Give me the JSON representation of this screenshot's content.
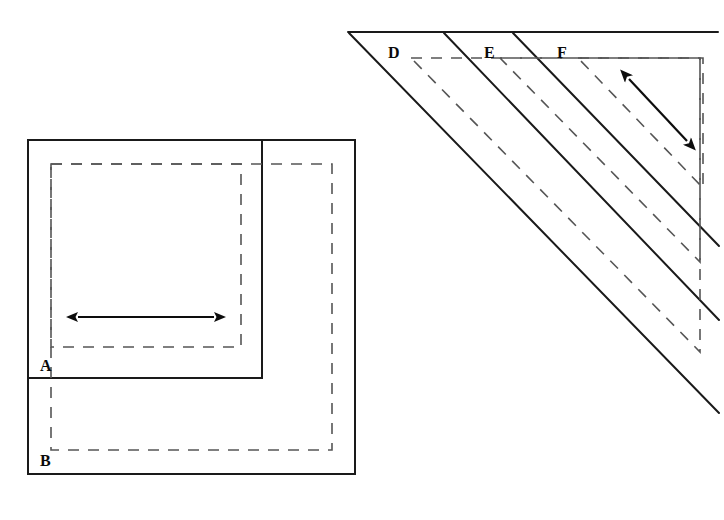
{
  "figure": {
    "title": "",
    "background_color": "#ffffff",
    "stroke_color": "#1a1a1a",
    "dashed_color": "#555555",
    "labels": {
      "a": "A",
      "b": "B",
      "d": "D",
      "e": "E",
      "f": "F"
    },
    "left_panel": {
      "name": "nested-squares-panel",
      "squares": [
        {
          "id": "A",
          "style": "solid",
          "x": 28,
          "y": 140,
          "width": 234,
          "height": 238
        },
        {
          "id": "B",
          "style": "solid",
          "x": 28,
          "y": 140,
          "width": 327,
          "height": 334
        }
      ],
      "dashed_squares": [
        {
          "id": "A-inner",
          "style": "dashed",
          "x": 51,
          "y": 164,
          "width": 190,
          "height": 183
        },
        {
          "id": "B-inner",
          "style": "dashed",
          "x": 51,
          "y": 164,
          "width": 281,
          "height": 286
        }
      ],
      "arrow": {
        "id": "horizontal-double-arrow",
        "type": "double-headed",
        "x1": 78,
        "y1": 317,
        "x2": 214,
        "y2": 317,
        "orientation": "horizontal"
      },
      "label_positions": [
        {
          "text": "A",
          "x": 40,
          "y": 370
        },
        {
          "text": "B",
          "x": 40,
          "y": 465
        }
      ]
    },
    "right_panel": {
      "name": "nested-triangles-panel",
      "top_edge": {
        "x1": 348,
        "y1": 32,
        "x2": 718,
        "y2": 32
      },
      "diagonals": [
        {
          "id": "D",
          "x1": 349,
          "y1": 32,
          "x2": 718,
          "y2": 412
        },
        {
          "id": "E",
          "x1": 444,
          "y1": 32,
          "x2": 718,
          "y2": 320
        },
        {
          "id": "F",
          "x1": 513,
          "y1": 32,
          "x2": 718,
          "y2": 246
        }
      ],
      "dashed_triangles": [
        {
          "id": "D-inner",
          "top_y": 58,
          "top_x1": 411,
          "top_x2": 700,
          "right_x": 700,
          "bottom_y": 350,
          "apex_x": 411
        },
        {
          "id": "E-inner",
          "top_y": 58,
          "top_x1": 500,
          "top_x2": 700,
          "right_x": 700,
          "bottom_y": 262,
          "apex_x": 500
        },
        {
          "id": "F-inner",
          "top_y": 58,
          "top_x1": 578,
          "top_x2": 703,
          "right_x": 703,
          "bottom_y": 188,
          "apex_x": 578
        }
      ],
      "arrow": {
        "id": "diagonal-double-arrow",
        "type": "double-headed",
        "x1": 629,
        "y1": 79,
        "x2": 687,
        "y2": 141,
        "orientation": "diagonal-down-right"
      },
      "label_positions": [
        {
          "text": "D",
          "x": 388,
          "y": 58
        },
        {
          "text": "E",
          "x": 484,
          "y": 58
        },
        {
          "text": "F",
          "x": 557,
          "y": 58
        }
      ]
    }
  }
}
